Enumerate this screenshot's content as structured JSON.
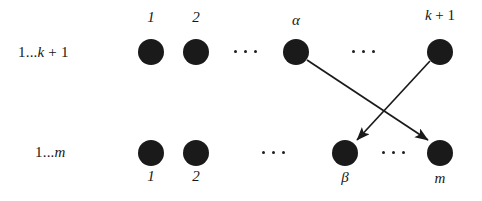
{
  "figure": {
    "width": 482,
    "height": 201,
    "background": "#ffffff",
    "ink_color": "#1a1a1a"
  },
  "rows": [
    {
      "id": "top-row",
      "label": "1...k + 1",
      "label_parts": {
        "prefix": "1...",
        "var": "k",
        "suffix": " + 1"
      },
      "label_x": 18,
      "label_y": 45,
      "node_y": 52,
      "labels_above": true
    },
    {
      "id": "bottom-row",
      "label": "1...m",
      "label_parts": {
        "prefix": "1...",
        "var": "m",
        "suffix": ""
      },
      "label_x": 35,
      "label_y": 145,
      "node_y": 153,
      "labels_above": false
    }
  ],
  "nodes": [
    {
      "id": "t1",
      "row": "top-row",
      "label": "1",
      "label_style": "italic",
      "cx": 151,
      "cy": 52,
      "r": 13
    },
    {
      "id": "t2",
      "row": "top-row",
      "label": "2",
      "label_style": "italic",
      "cx": 196,
      "cy": 52,
      "r": 13
    },
    {
      "id": "alpha",
      "row": "top-row",
      "label": "α",
      "label_style": "italic",
      "cx": 296,
      "cy": 52,
      "r": 13
    },
    {
      "id": "kplus1",
      "row": "top-row",
      "label": "k + 1",
      "label_style": "italic-mixed",
      "cx": 440,
      "cy": 52,
      "r": 13
    },
    {
      "id": "b1",
      "row": "bottom-row",
      "label": "1",
      "label_style": "italic",
      "cx": 151,
      "cy": 153,
      "r": 13
    },
    {
      "id": "b2",
      "row": "bottom-row",
      "label": "2",
      "label_style": "italic",
      "cx": 196,
      "cy": 153,
      "r": 13
    },
    {
      "id": "beta",
      "row": "bottom-row",
      "label": "β",
      "label_style": "italic",
      "cx": 345,
      "cy": 153,
      "r": 13
    },
    {
      "id": "m",
      "row": "bottom-row",
      "label": "m",
      "label_style": "italic",
      "cx": 440,
      "cy": 153,
      "r": 13
    }
  ],
  "ellipses": [
    {
      "id": "top-left-ellipsis",
      "x": 234,
      "y": 51,
      "dots": 3
    },
    {
      "id": "top-right-ellipsis",
      "x": 352,
      "y": 51,
      "dots": 3
    },
    {
      "id": "bottom-left-ellipsis",
      "x": 262,
      "y": 152,
      "dots": 3
    },
    {
      "id": "bottom-right-ellipsis",
      "x": 382,
      "y": 152,
      "dots": 3
    }
  ],
  "edges": [
    {
      "id": "alpha-to-m",
      "from": "alpha",
      "to": "m",
      "x1": 307,
      "y1": 60,
      "x2": 430,
      "y2": 142,
      "arrowhead": true
    },
    {
      "id": "kplus1-to-beta",
      "from": "kplus1",
      "to": "beta",
      "x1": 430,
      "y1": 61,
      "x2": 356,
      "y2": 142,
      "arrowhead": true
    }
  ]
}
